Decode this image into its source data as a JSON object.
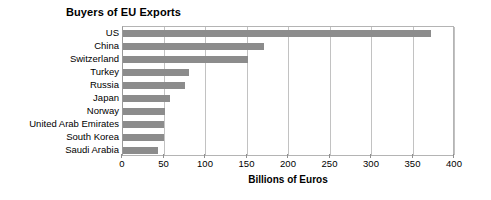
{
  "chart_data": {
    "type": "bar",
    "orientation": "horizontal",
    "title": "Buyers of EU Exports",
    "xlabel": "Billions of Euros",
    "ylabel": "",
    "xlim": [
      0,
      400
    ],
    "xticks": [
      0,
      50,
      100,
      150,
      200,
      250,
      300,
      350,
      400
    ],
    "xtick_labels": [
      "0",
      "50",
      "100",
      "150",
      "200",
      "250",
      "300",
      "350",
      "400"
    ],
    "grid": "vertical",
    "legend": "none",
    "bar_color": "#8c8c8c",
    "categories": [
      "US",
      "China",
      "Switzerland",
      "Turkey",
      "Russia",
      "Japan",
      "Norway",
      "United Arab Emirates",
      "South Korea",
      "Saudi Arabia"
    ],
    "values": [
      371,
      170,
      150,
      80,
      75,
      57,
      50,
      49,
      49,
      42
    ],
    "series": [
      {
        "name": "Billions of Euros",
        "values": [
          371,
          170,
          150,
          80,
          75,
          57,
          50,
          49,
          49,
          42
        ]
      }
    ]
  }
}
